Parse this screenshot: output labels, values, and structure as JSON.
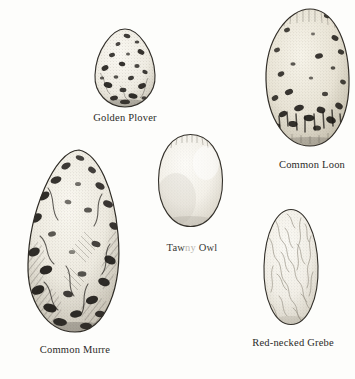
{
  "plate": {
    "title": "Bird egg identification plate",
    "background_color": "#fdfdfb",
    "ink_color": "#2b2a28",
    "width": 355,
    "height": 379
  },
  "specimens": [
    {
      "id": "golden-plover",
      "label": "Golden Plover",
      "shape": "pyriform",
      "ground_color": "#f2efe6",
      "marking_color": "#201d1a",
      "marking_description": "heavy dark brown and black blotches, densest toward the blunt end",
      "bounds": {
        "x": 92,
        "y": 28,
        "w": 66,
        "h": 80
      },
      "caption_pos": {
        "x": 125,
        "y": 113
      },
      "caption_size": 10.5
    },
    {
      "id": "common-loon",
      "label": "Common Loon",
      "shape": "elongated-oval",
      "ground_color": "#ece7da",
      "marking_color": "#211e1a",
      "marking_description": "olive-brown ground with scattered dark spots and a dense dark band near the base; right edge cropped by page margin",
      "bounds": {
        "x": 263,
        "y": 8,
        "w": 92,
        "h": 140
      },
      "caption_pos": {
        "x": 312,
        "y": 160
      },
      "caption_size": 10.5
    },
    {
      "id": "tawny-owl",
      "label": "Tawny Owl",
      "shape": "near-spherical",
      "ground_color": "#f6f4ee",
      "marking_color": "#9a958c",
      "marking_description": "plain unmarked white, softly stippled with a flattened crown",
      "bounds": {
        "x": 156,
        "y": 133,
        "w": 69,
        "h": 95
      },
      "caption_pos": {
        "x": 192,
        "y": 243
      },
      "caption_size": 10.5,
      "caption_faded": true,
      "caption_parts": {
        "head": "Taw",
        "faded": "ny",
        "tail": " Owl"
      }
    },
    {
      "id": "common-murre",
      "label": "Common Murre",
      "shape": "strongly-pyriform",
      "ground_color": "#efece2",
      "marking_color": "#1c1916",
      "marking_description": "large pear-shaped egg, boldly scrawled and blotched with black and dark grey",
      "bounds": {
        "x": 22,
        "y": 148,
        "w": 106,
        "h": 186
      },
      "caption_pos": {
        "x": 75,
        "y": 345
      },
      "caption_size": 10.5
    },
    {
      "id": "red-necked-grebe",
      "label": "Red-necked Grebe",
      "shape": "elongated-oval",
      "ground_color": "#f4f1e9",
      "marking_color": "#a39d92",
      "marking_description": "chalky pale shell covered in a fine crackled network of vein-like lines",
      "bounds": {
        "x": 261,
        "y": 208,
        "w": 60,
        "h": 118
      },
      "caption_pos": {
        "x": 293,
        "y": 338
      },
      "caption_size": 10.5
    }
  ]
}
